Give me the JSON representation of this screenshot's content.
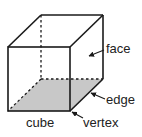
{
  "diagram": {
    "title": "cube",
    "labels": {
      "face": "face",
      "edge": "edge",
      "vertex": "vertex",
      "cube": "cube"
    },
    "colors": {
      "line": "#1a1a1a",
      "shade": "#c8c8c8",
      "background": "#ffffff"
    }
  }
}
